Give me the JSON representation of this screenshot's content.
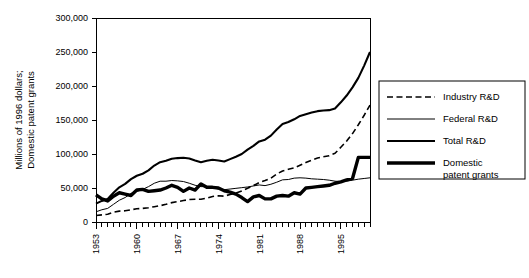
{
  "chart_data": {
    "type": "line",
    "title": "",
    "xlabel": "",
    "ylabel": "Millions of 1996 dollars; Domestic patent grants",
    "ylim": [
      0,
      300000
    ],
    "yticks": [
      0,
      50000,
      100000,
      150000,
      200000,
      250000,
      300000
    ],
    "ytick_labels": [
      "0",
      "50,000",
      "100,000",
      "150,000",
      "200,000",
      "250,000",
      "300,000"
    ],
    "xlim": [
      1953,
      2000
    ],
    "xticks": [
      1953,
      1960,
      1967,
      1974,
      1981,
      1988,
      1995
    ],
    "xtick_labels": [
      "1953",
      "1960",
      "1967",
      "1974",
      "1981",
      "1988",
      "1995"
    ],
    "minor_xticks_every": 1,
    "grid": false,
    "legend_position": "right",
    "x": [
      1953,
      1954,
      1955,
      1956,
      1957,
      1958,
      1959,
      1960,
      1961,
      1962,
      1963,
      1964,
      1965,
      1966,
      1967,
      1968,
      1969,
      1970,
      1971,
      1972,
      1973,
      1974,
      1975,
      1976,
      1977,
      1978,
      1979,
      1980,
      1981,
      1982,
      1983,
      1984,
      1985,
      1986,
      1987,
      1988,
      1989,
      1990,
      1991,
      1992,
      1993,
      1994,
      1995,
      1996,
      1997,
      1998,
      1999,
      2000
    ],
    "series": [
      {
        "name": "Industry R&D",
        "style": "dashed",
        "width": 1.6,
        "values": [
          9500,
          10500,
          11500,
          14500,
          16000,
          16500,
          18000,
          19500,
          20000,
          21000,
          22500,
          24000,
          26000,
          28500,
          30000,
          31500,
          33000,
          33500,
          33500,
          35000,
          37500,
          38500,
          38000,
          40500,
          42500,
          45500,
          49500,
          53500,
          58000,
          61000,
          64500,
          70500,
          75000,
          77500,
          79500,
          83500,
          87500,
          91000,
          94000,
          96000,
          97500,
          101000,
          110000,
          119000,
          130000,
          143000,
          157000,
          172000
        ]
      },
      {
        "name": "Federal R&D",
        "style": "thin",
        "width": 1.0,
        "values": [
          15000,
          18000,
          20000,
          26000,
          32000,
          36000,
          42000,
          45000,
          48000,
          52000,
          57000,
          60000,
          60000,
          61000,
          60500,
          59500,
          57000,
          54000,
          52000,
          52000,
          50500,
          48500,
          47500,
          48500,
          49500,
          50500,
          51500,
          53000,
          54500,
          53500,
          55500,
          58500,
          62000,
          62500,
          64500,
          65000,
          64500,
          63500,
          63000,
          62500,
          61500,
          60000,
          59500,
          60000,
          61500,
          63000,
          64000,
          65000
        ]
      },
      {
        "name": "Total R&D",
        "style": "medium",
        "width": 2.1,
        "values": [
          27000,
          31000,
          34000,
          43000,
          51000,
          56000,
          63000,
          68000,
          71000,
          76000,
          83000,
          88000,
          90000,
          93000,
          94000,
          94500,
          93500,
          90500,
          88000,
          90000,
          91500,
          90500,
          89000,
          92500,
          96000,
          100000,
          106500,
          112000,
          118500,
          121000,
          127000,
          136000,
          144000,
          147000,
          151000,
          156000,
          158500,
          161000,
          163000,
          164000,
          164500,
          167000,
          176000,
          186000,
          198000,
          212000,
          230000,
          250000
        ]
      },
      {
        "name": "Domestic patent grants",
        "label_lines": [
          "Domestic",
          "patent grants"
        ],
        "style": "thick",
        "width": 3.4,
        "values": [
          40000,
          34000,
          31000,
          38000,
          43000,
          41000,
          39000,
          47000,
          48000,
          45000,
          46000,
          47000,
          50000,
          54000,
          51000,
          45000,
          50000,
          47000,
          56000,
          51000,
          51000,
          50000,
          46000,
          44000,
          41000,
          36000,
          30000,
          37000,
          39000,
          34000,
          34000,
          38000,
          39000,
          38000,
          43000,
          41000,
          50000,
          51000,
          52000,
          53000,
          54000,
          57000,
          59000,
          62000,
          64000,
          95000,
          95000,
          95000
        ]
      }
    ]
  },
  "axis": {
    "ylabel_line1": "Millions of 1996 dollars;",
    "ylabel_line2": "Domestic patent grants"
  },
  "legend": {
    "items": [
      {
        "label": "Industry R&D",
        "style": "dashed"
      },
      {
        "label": "Federal R&D",
        "style": "thin"
      },
      {
        "label": "Total R&D",
        "style": "medium"
      },
      {
        "label": "Domestic",
        "label2": "patent grants",
        "style": "thick"
      }
    ]
  }
}
